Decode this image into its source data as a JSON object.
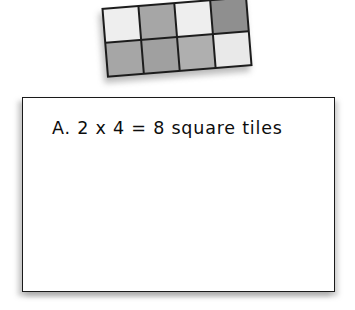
{
  "page": {
    "background_color": "#ffffff",
    "width": 355,
    "height": 310
  },
  "manipulative": {
    "name": "square-tiles-array",
    "rows": 2,
    "columns": 4,
    "total_tiles": 8,
    "rotation_degrees": -4.6,
    "grid_line_color": "#1c1c1c",
    "tiles": [
      {
        "row": 1,
        "column": 1,
        "shade": "light",
        "color": "#eeeeee"
      },
      {
        "row": 1,
        "column": 2,
        "shade": "gray",
        "color": "#a6a6a6"
      },
      {
        "row": 1,
        "column": 3,
        "shade": "light",
        "color": "#eeeeee"
      },
      {
        "row": 1,
        "column": 4,
        "shade": "dark",
        "color": "#8f8f8f"
      },
      {
        "row": 2,
        "column": 1,
        "shade": "gray",
        "color": "#a6a6a6"
      },
      {
        "row": 2,
        "column": 2,
        "shade": "gray",
        "color": "#a0a0a0"
      },
      {
        "row": 2,
        "column": 3,
        "shade": "gray",
        "color": "#afafaf"
      },
      {
        "row": 2,
        "column": 4,
        "shade": "light",
        "color": "#e9e9e9"
      }
    ]
  },
  "answer_box": {
    "border_color": "#1a1a1a",
    "background_color": "#ffffff",
    "answer_text": "A. 2 x 4 = 8 square tiles",
    "choice_letter": "A.",
    "expression": "2 x 4 = 8",
    "unit_label": "square tiles"
  }
}
